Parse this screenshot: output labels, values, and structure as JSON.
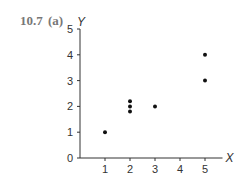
{
  "figure_label": {
    "number": "10.7",
    "part": "(a)"
  },
  "chart_data": {
    "type": "scatter",
    "title": "",
    "xlabel": "X",
    "ylabel": "Y",
    "xlim": [
      0,
      5.5
    ],
    "ylim": [
      0,
      5
    ],
    "x_ticks": [
      "1",
      "2",
      "3",
      "4",
      "5"
    ],
    "y_ticks": [
      "0",
      "1",
      "2",
      "3",
      "4",
      "5"
    ],
    "grid": false,
    "legend": null,
    "points": [
      {
        "x": 1,
        "y": 1
      },
      {
        "x": 2,
        "y": 2.2
      },
      {
        "x": 2,
        "y": 2.0
      },
      {
        "x": 2,
        "y": 1.8
      },
      {
        "x": 3,
        "y": 2
      },
      {
        "x": 5,
        "y": 4
      },
      {
        "x": 5,
        "y": 3
      }
    ]
  }
}
